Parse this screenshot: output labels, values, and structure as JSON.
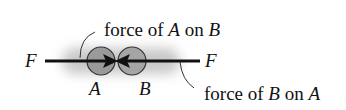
{
  "diagram": {
    "left_force_label": "F",
    "right_force_label": "F",
    "body_a_label": "A",
    "body_b_label": "B",
    "callout_top": {
      "prefix": "force of ",
      "subject": "A",
      "mid": " on ",
      "object": "B"
    },
    "callout_bottom": {
      "prefix": "force of ",
      "subject": "B",
      "mid": " on ",
      "object": "A"
    },
    "colors": {
      "line": "#111111",
      "circle_fill": "#9a9a9a",
      "circle_stroke": "#333333",
      "glow": "#c8c8c8"
    }
  }
}
